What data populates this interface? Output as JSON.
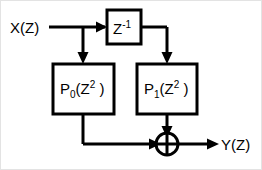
{
  "diagram": {
    "background_color": "#ffffff",
    "line_color": "#000000",
    "border_color": "#e3e3e3",
    "input": {
      "label_main": "X(Z)",
      "name": "input-signal"
    },
    "output": {
      "label_main": "Y(Z)",
      "name": "output-signal"
    },
    "blocks": [
      {
        "id": "delay",
        "label_base": "Z",
        "label_sup": "-1",
        "full_text": "Z^-1",
        "description": "unit delay element"
      },
      {
        "id": "p0",
        "label_base": "P",
        "label_sub": "0",
        "label_paren_open": "(Z",
        "label_sup": "2",
        "label_paren_close": " )",
        "full_text": "P0(Z^2 )",
        "description": "polyphase filter branch zero"
      },
      {
        "id": "p1",
        "label_base": "P",
        "label_sub": "1",
        "label_paren_open": "(Z",
        "label_sup": "2",
        "label_paren_close": " )",
        "full_text": "P1(Z^2 )",
        "description": "polyphase filter branch one"
      }
    ],
    "adder": {
      "id": "adder",
      "symbol": "plus-circle",
      "description": "summing junction"
    },
    "connections": [
      {
        "from": "input",
        "to": "delay"
      },
      {
        "from": "input-branch",
        "to": "p0"
      },
      {
        "from": "delay",
        "to": "p1"
      },
      {
        "from": "p0",
        "to": "adder"
      },
      {
        "from": "p1",
        "to": "adder"
      },
      {
        "from": "adder",
        "to": "output"
      }
    ]
  }
}
